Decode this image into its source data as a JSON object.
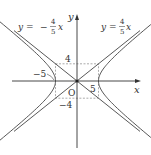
{
  "diagram": {
    "axes": {
      "x_label": "x",
      "y_label": "y",
      "origin_label": "O"
    },
    "asymptotes": [
      {
        "label_lhs": "y =",
        "sign": "",
        "num": "4",
        "den": "5",
        "var": "x",
        "slope": 0.8
      },
      {
        "label_lhs": "y =",
        "sign": "−",
        "num": "4",
        "den": "5",
        "var": "x",
        "slope": -0.8
      }
    ],
    "ticks": {
      "x_pos": "5",
      "x_neg": "−5",
      "y_pos": "4",
      "y_neg": "−4"
    },
    "a": 5,
    "b": 4,
    "colors": {
      "curve": "#444444",
      "axis": "#333333",
      "dash": "#888888"
    }
  }
}
